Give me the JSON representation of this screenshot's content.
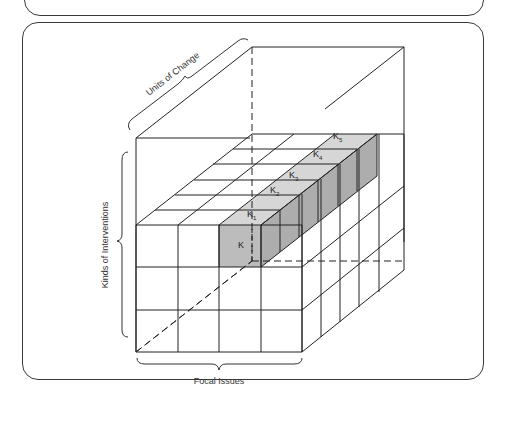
{
  "figure": {
    "type": "3d-cube-matrix",
    "axes": {
      "depth_label": "Units of Change",
      "vertical_label": "Kinds of Interventions",
      "horizontal_label": "Focal Issues"
    },
    "grid": {
      "columns": 4,
      "rows": 3,
      "depth": 6
    },
    "highlighted_column": {
      "labels": [
        "K",
        "K1",
        "K2",
        "K3",
        "K4",
        "K5"
      ],
      "display": [
        {
          "base": "K",
          "sub": ""
        },
        {
          "base": "K",
          "sub": "1"
        },
        {
          "base": "K",
          "sub": "2"
        },
        {
          "base": "K",
          "sub": "3"
        },
        {
          "base": "K",
          "sub": "4"
        },
        {
          "base": "K",
          "sub": "5"
        }
      ],
      "fill_top": "#d4d4d4",
      "fill_front": "#b8b8b8",
      "fill_side": "#a9a9a9"
    },
    "line_color": "#222222"
  }
}
